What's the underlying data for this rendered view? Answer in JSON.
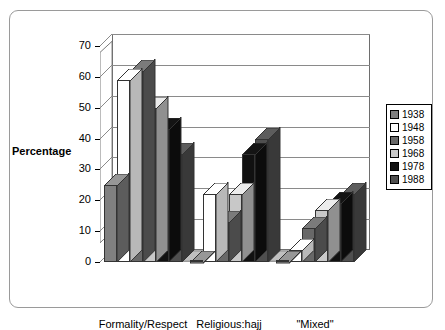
{
  "figure": {
    "yaxis_title": "Percentage"
  },
  "legend": {
    "entries": [
      {
        "label": "1938",
        "color": "#808080"
      },
      {
        "label": "1948",
        "color": "#ffffff"
      },
      {
        "label": "1958",
        "color": "#686868"
      },
      {
        "label": "1968",
        "color": "#c8c8c8"
      },
      {
        "label": "1978",
        "color": "#111111"
      },
      {
        "label": "1988",
        "color": "#4f4f4f"
      }
    ]
  },
  "chart_data": {
    "type": "bar",
    "title": "",
    "xlabel": "",
    "ylabel": "Percentage",
    "ylim": [
      0,
      70
    ],
    "yticks": [
      0,
      10,
      20,
      30,
      40,
      50,
      60,
      70
    ],
    "grid": true,
    "legend_position": "right",
    "categories": [
      "Formality/Respect",
      "Religious:hajj",
      "\"Mixed\""
    ],
    "series": [
      {
        "name": "1938",
        "color": "#808080",
        "values": [
          25,
          0,
          0
        ]
      },
      {
        "name": "1948",
        "color": "#ffffff",
        "values": [
          59,
          22,
          4
        ]
      },
      {
        "name": "1958",
        "color": "#686868",
        "values": [
          62,
          13,
          11
        ]
      },
      {
        "name": "1968",
        "color": "#c8c8c8",
        "values": [
          50,
          22,
          17
        ]
      },
      {
        "name": "1978",
        "color": "#111111",
        "values": [
          43,
          35,
          19
        ]
      },
      {
        "name": "1988",
        "color": "#4f4f4f",
        "values": [
          35,
          40,
          22
        ]
      }
    ]
  }
}
